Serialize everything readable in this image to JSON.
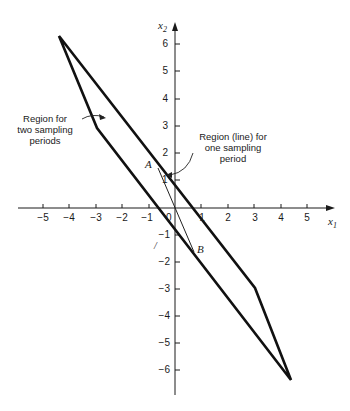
{
  "figure": {
    "axes": {
      "x_label": "x",
      "x_label_sub": "1",
      "y_label": "x",
      "y_label_sub": "2",
      "origin_label": "0",
      "x_ticks": [
        "−5",
        "−4",
        "−3",
        "−2",
        "−1",
        "1",
        "2",
        "3",
        "4",
        "5"
      ],
      "y_ticks_pos": [
        "6",
        "5",
        "4",
        "3",
        "2",
        "1"
      ],
      "y_ticks_neg": [
        "−1",
        "−2",
        "−3",
        "−4",
        "−5",
        "−6"
      ]
    },
    "points": {
      "A": "A",
      "B": "B"
    },
    "annotations": {
      "two_periods": [
        "Region for",
        "two sampling",
        "periods"
      ],
      "one_period": [
        "Region (line) for",
        "one sampling",
        "period"
      ],
      "stray_mark": "/"
    },
    "region_vertices": [
      [
        -4.4,
        6.35
      ],
      [
        -3,
        3
      ],
      [
        4.4,
        -6.35
      ],
      [
        3,
        -3
      ]
    ],
    "segment_AB": [
      [
        -0.6,
        1.5
      ],
      [
        0.7,
        -1.6
      ]
    ]
  }
}
